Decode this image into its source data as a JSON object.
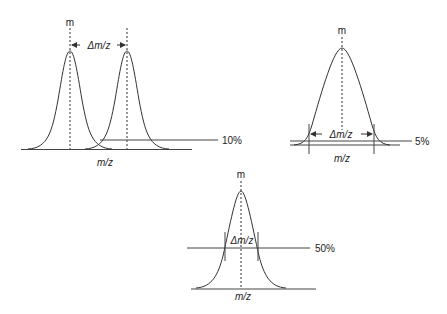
{
  "diagrams": {
    "two_peaks": {
      "peak_label": "m",
      "delta_label": "Δm/z",
      "threshold_label": "10%",
      "axis_label": "m/z"
    },
    "single_peak_5": {
      "peak_label": "m",
      "delta_label": "Δm/z",
      "threshold_label": "5%",
      "axis_label": "m/z"
    },
    "single_peak_50": {
      "peak_label": "m",
      "delta_label": "Δm/z",
      "threshold_label": "50%",
      "axis_label": "m/z"
    }
  },
  "colors": {
    "line": "#333333",
    "background": "#ffffff"
  }
}
